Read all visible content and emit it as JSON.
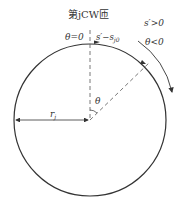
{
  "diagram": {
    "title_label": "第jCW匝",
    "theta_zero_label": "θ=0",
    "s_label": "s′−s",
    "s_sub": "j0",
    "s_positive_label": "s′>0",
    "theta_negative_label": "θ<0",
    "theta_label": "θ",
    "radius_label": "r",
    "radius_sub": "j",
    "colors": {
      "stroke": "#333333",
      "dashed": "#555555"
    }
  }
}
